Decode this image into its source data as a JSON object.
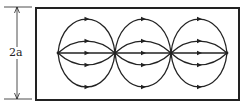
{
  "diagram": {
    "dimension_label": "2a",
    "colors": {
      "stroke": "#222222",
      "background": "#ffffff"
    },
    "box": {
      "x": 36,
      "y": 8,
      "width": 203,
      "height": 92
    },
    "centerline_y": 53,
    "nodes_x": [
      58,
      115,
      171,
      227
    ],
    "lobe_offsets": [
      -34,
      -12,
      0,
      12,
      34
    ],
    "arrow_direction": "right",
    "dimension": {
      "x": 17,
      "y1": 7,
      "y2": 99
    }
  }
}
